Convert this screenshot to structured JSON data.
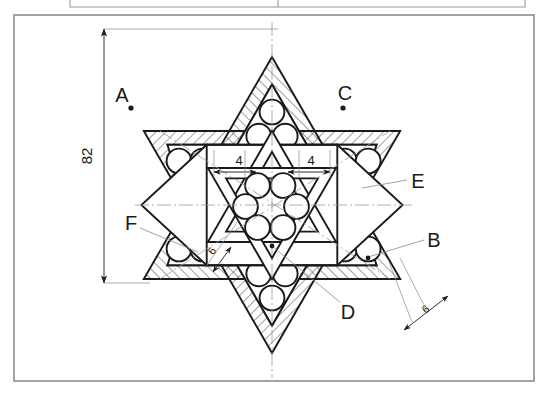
{
  "drawing": {
    "title": "Hexagram sphere-packing assembly drawing",
    "sheet_frame": {
      "outer_border_color": "#8a8a8a",
      "top_strip_visible": true
    },
    "colors": {
      "line": "#1a1a1a",
      "hatch": "#333333",
      "thin": "#8a8a8a",
      "dim": "#555555",
      "background": "#ffffff"
    },
    "dimensions": [
      {
        "id": "overall-height",
        "value": "82",
        "orientation": "vertical",
        "position": "left"
      },
      {
        "id": "inner-left-gap",
        "value": "4",
        "orientation": "horizontal",
        "position": "center-left"
      },
      {
        "id": "inner-right-gap",
        "value": "4",
        "orientation": "horizontal",
        "position": "center-right"
      },
      {
        "id": "band-width-inner",
        "value": "6",
        "orientation": "oblique",
        "position": "center-lower-left"
      },
      {
        "id": "band-width-outer",
        "value": "6",
        "orientation": "oblique",
        "position": "lower-right"
      }
    ],
    "callouts": [
      {
        "id": "A",
        "label": "A",
        "x": 122,
        "y": 98,
        "kind": "point-marker"
      },
      {
        "id": "C",
        "label": "C",
        "x": 345,
        "y": 96,
        "kind": "point-marker"
      },
      {
        "id": "E",
        "label": "E",
        "x": 413,
        "y": 182,
        "kind": "leader"
      },
      {
        "id": "B",
        "label": "B",
        "x": 431,
        "y": 241,
        "kind": "leader"
      },
      {
        "id": "D",
        "label": "D",
        "x": 346,
        "y": 311,
        "kind": "leader"
      },
      {
        "id": "F",
        "label": "F",
        "x": 129,
        "y": 225,
        "kind": "leader"
      }
    ],
    "geometry": {
      "center_x": 272,
      "center_y": 205,
      "outer_star_radius": 148,
      "band_thickness": 6,
      "spheres_per_point": 3,
      "center_sphere_count": 6,
      "star_points": 6,
      "hatch_angle_deg": 45
    }
  }
}
